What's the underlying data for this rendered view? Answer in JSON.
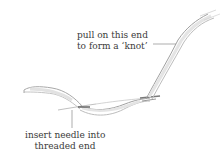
{
  "diagram": {
    "title": "",
    "labels": {
      "pull_end": {
        "line1": "pull on this end",
        "line2": "to form a ‘knot’"
      },
      "insert_needle": {
        "line1": "insert needle into",
        "line2": "threaded end"
      }
    },
    "colors": {
      "thread_stroke": "#9a9a9a",
      "thread_fill": "#e6e6e6",
      "thread_shade": "#b8b8b8",
      "knot_dark": "#6f6f6f",
      "leader_line": "#8a8a8a",
      "text": "#3a3a3a",
      "background": "#ffffff"
    }
  }
}
